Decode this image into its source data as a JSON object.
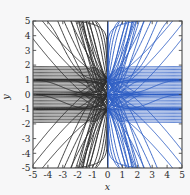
{
  "figure": {
    "background_color": "#f7f7f8",
    "plot_background_color": "#ffffff",
    "frame_color": "#4a4a4a"
  },
  "chart_data": {
    "type": "line",
    "title": "",
    "subtitle": "",
    "xlabel": "x",
    "ylabel": "y",
    "xlim": [
      -5,
      5
    ],
    "ylim": [
      -5,
      5
    ],
    "grid": false,
    "legend": null,
    "xticks": [
      -5,
      -4,
      -3,
      -2,
      -1,
      0,
      1,
      2,
      3,
      4,
      5
    ],
    "yticks": [
      -5,
      -4,
      -3,
      -2,
      -1,
      0,
      1,
      2,
      3,
      4,
      5
    ],
    "xticklabels": [
      "-5",
      "-4",
      "-3",
      "-2",
      "-1",
      "0",
      "1",
      "2",
      "3",
      "4",
      "5"
    ],
    "yticklabels": [
      "-5",
      "-4",
      "-3",
      "-2",
      "-1",
      "0",
      "1",
      "2",
      "3",
      "4",
      "5"
    ],
    "tick_direction": "in",
    "ticks_on_all_sides": true,
    "singular_points": [
      {
        "x": 0,
        "y": 1
      },
      {
        "x": 0,
        "y": 0
      },
      {
        "x": 0,
        "y": -1
      }
    ],
    "separatrix_lines": [
      {
        "kind": "horizontal",
        "y": 1
      },
      {
        "kind": "horizontal",
        "y": 0
      },
      {
        "kind": "horizontal",
        "y": -1
      },
      {
        "kind": "vertical",
        "x": 0
      }
    ],
    "series": [
      {
        "name": "left-branch-curves",
        "color": "#2e2e2e",
        "linewidth": 0.9,
        "half_plane": "x<0",
        "count": 34
      },
      {
        "name": "right-branch-curves",
        "color": "#2f5fc4",
        "linewidth": 0.9,
        "half_plane": "x>0",
        "count": 34
      }
    ]
  },
  "axes": {
    "x_axis_label": "x",
    "y_axis_label": "y"
  }
}
